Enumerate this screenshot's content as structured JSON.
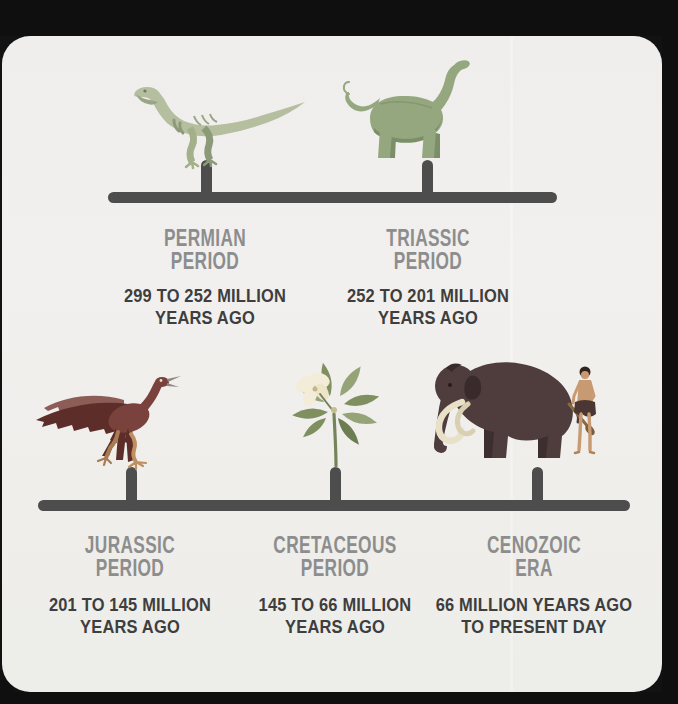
{
  "infographic": {
    "title": "Geologic time periods timeline",
    "colors": {
      "background": "#121212",
      "card": "#f0efed",
      "timeline": "#4d4d4d",
      "heading": "#8d8d8d",
      "subtext": "#3e3e3e",
      "permian_dinosaur_green": "#b5bfa0",
      "triassic_sauropod_green": "#94a77f",
      "jurassic_archaeopteryx_maroon": "#7a423c",
      "cretaceous_leaf_green": "#95a478",
      "cretaceous_flower_cream": "#f3ecd8",
      "cenozoic_mammoth_brown": "#4f3c3c",
      "tusk_cream": "#e9e0c8",
      "human_skin_tan": "#c79a72"
    },
    "periods": [
      {
        "id": "permian",
        "name": [
          "PERMIAN",
          "PERIOD"
        ],
        "range": [
          "299 TO 252 MILLION",
          "YEARS AGO"
        ],
        "illustration": "coelophysis-theropod-dinosaur"
      },
      {
        "id": "triassic",
        "name": [
          "TRIASSIC",
          "PERIOD"
        ],
        "range": [
          "252 TO 201 MILLION",
          "YEARS AGO"
        ],
        "illustration": "sauropod-dinosaur"
      },
      {
        "id": "jurassic",
        "name": [
          "JURASSIC",
          "PERIOD"
        ],
        "range": [
          "201 TO 145 MILLION",
          "YEARS AGO"
        ],
        "illustration": "archaeopteryx-feathered-dinosaur"
      },
      {
        "id": "cretaceous",
        "name": [
          "CRETACEOUS",
          "PERIOD"
        ],
        "range": [
          "145 TO 66 MILLION",
          "YEARS AGO"
        ],
        "illustration": "magnolia-flowering-plant"
      },
      {
        "id": "cenozoic",
        "name": [
          "CENOZOIC",
          "ERA"
        ],
        "range": [
          "66 MILLION YEARS AGO",
          "TO PRESENT DAY"
        ],
        "illustration": "woolly-mammoth-and-early-human"
      }
    ]
  }
}
